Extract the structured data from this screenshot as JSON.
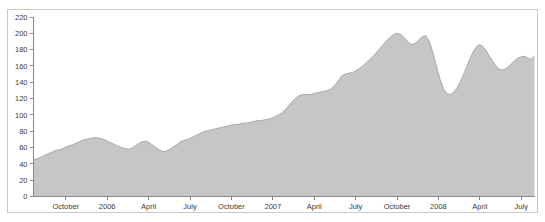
{
  "chart_data": {
    "type": "area",
    "title": "",
    "subtitle": "",
    "xlabel": "",
    "ylabel": "",
    "grid": false,
    "legend": "none",
    "fill_color": "#c6c6c6",
    "line_color": "#a9a9a9",
    "axis_color": "#8a8a8a",
    "background_color": "#ffffff",
    "border_color": "#c9c9c9",
    "ylim": [
      0,
      220
    ],
    "yticks": [
      0,
      20,
      40,
      60,
      80,
      100,
      120,
      140,
      160,
      180,
      200,
      220
    ],
    "ytick_labels": [
      "0",
      "20",
      "40",
      "60",
      "80",
      "100",
      "120",
      "140",
      "160",
      "180",
      "200",
      "220"
    ],
    "xtick_labels": [
      "October",
      "2006",
      "April",
      "July",
      "October",
      "2007",
      "April",
      "July",
      "October",
      "2008",
      "April",
      "July"
    ],
    "xtick_positions": [
      0.093,
      0.187,
      0.281,
      0.375,
      0.469,
      0.562,
      0.656,
      0.75,
      0.843,
      0.906,
      0.937,
      0.969
    ],
    "series": [
      {
        "name": "value",
        "values": [
          45,
          46,
          48,
          50,
          52,
          54,
          56,
          57,
          58,
          60,
          62,
          63,
          65,
          67,
          69,
          70,
          71,
          72,
          72,
          71,
          70,
          68,
          66,
          64,
          62,
          60,
          59,
          58,
          59,
          62,
          65,
          67,
          68,
          66,
          63,
          60,
          57,
          55,
          56,
          58,
          61,
          64,
          67,
          69,
          70,
          72,
          74,
          76,
          78,
          80,
          81,
          82,
          83,
          84,
          85,
          86,
          87,
          88,
          88,
          89,
          90,
          90,
          91,
          92,
          93,
          93,
          94,
          95,
          96,
          98,
          100,
          103,
          107,
          112,
          117,
          121,
          124,
          125,
          125,
          125,
          126,
          127,
          128,
          129,
          130,
          132,
          136,
          142,
          148,
          150,
          151,
          152,
          154,
          157,
          160,
          164,
          168,
          172,
          177,
          182,
          187,
          192,
          196,
          199,
          200,
          198,
          194,
          189,
          186,
          188,
          192,
          196,
          197,
          190,
          176,
          160,
          144,
          132,
          126,
          125,
          128,
          134,
          142,
          152,
          163,
          173,
          181,
          186,
          185,
          180,
          173,
          166,
          160,
          156,
          155,
          157,
          161,
          165,
          169,
          171,
          172,
          170,
          168,
          172
        ]
      }
    ]
  }
}
